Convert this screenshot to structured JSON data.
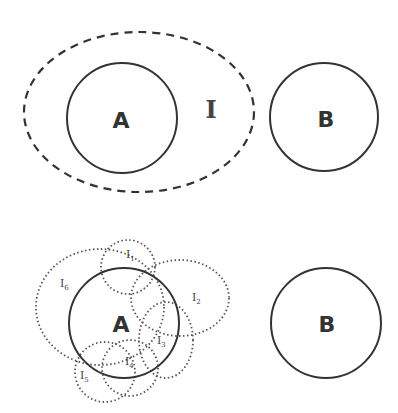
{
  "top": {
    "set_a_label": "A",
    "set_b_label": "B",
    "region_label": "I"
  },
  "bottom": {
    "set_a_label": "A",
    "set_b_label": "B",
    "subregions": [
      {
        "label": "I",
        "sub": "1"
      },
      {
        "label": "I",
        "sub": "2"
      },
      {
        "label": "I",
        "sub": "3"
      },
      {
        "label": "I",
        "sub": "4"
      },
      {
        "label": "I",
        "sub": "5"
      },
      {
        "label": "I",
        "sub": "6"
      }
    ]
  },
  "colors": {
    "stroke": "#333333",
    "dotted": "#555555"
  }
}
